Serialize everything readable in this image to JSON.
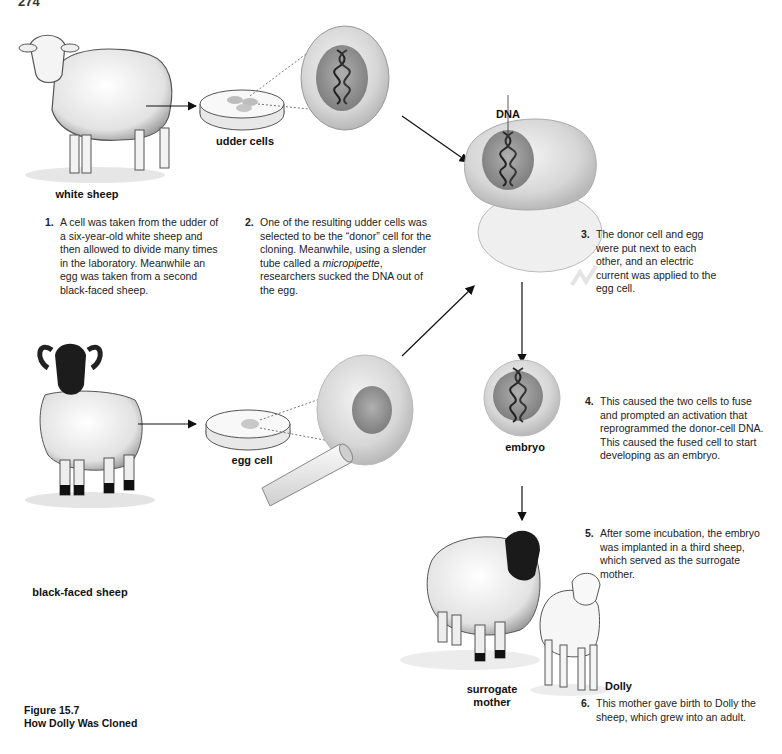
{
  "page_number": "274",
  "figure": {
    "number": "Figure 15.7",
    "title": "How Dolly Was Cloned"
  },
  "labels": {
    "white_sheep": "white sheep",
    "udder_cells": "udder cells",
    "dna": "DNA",
    "black_faced_sheep": "black-faced sheep",
    "egg_cell": "egg cell",
    "embryo": "embryo",
    "surrogate_mother_line1": "surrogate",
    "surrogate_mother_line2": "mother",
    "dolly": "Dolly"
  },
  "steps": [
    {
      "num": "1.",
      "text_lines": [
        "A cell was taken from the udder of",
        "a six-year-old white sheep and",
        "then allowed to divide many times",
        "in the laboratory. Meanwhile an",
        "egg was taken from a second",
        "black-faced sheep."
      ]
    },
    {
      "num": "2.",
      "text_pre": "One of the resulting udder cells was selected to be the “donor” cell for the cloning. Meanwhile, using a slender tube called a ",
      "text_em": "micropipette",
      "text_post": ", researchers sucked the DNA out of the egg."
    },
    {
      "num": "3.",
      "text": "The donor cell and egg were put next to each other, and an electric current was applied to the egg cell."
    },
    {
      "num": "4.",
      "text": "This caused the two cells to fuse and prompted an activation that reprogrammed the donor-cell DNA. This caused the fused cell to start developing as an embryo."
    },
    {
      "num": "5.",
      "text": "After some incubation, the embryo was implanted in a third sheep, which served as the surrogate mother."
    },
    {
      "num": "6.",
      "text": "This mother gave birth to Dolly the sheep, which grew into an adult."
    }
  ],
  "illustrations": [
    {
      "name": "white-sheep",
      "icon": "sheep-illustration"
    },
    {
      "name": "udder-cells-dish",
      "icon": "petri-dish-illustration"
    },
    {
      "name": "donor-cell",
      "icon": "cell-with-dna-illustration"
    },
    {
      "name": "fused-cells",
      "icon": "fused-cells-illustration"
    },
    {
      "name": "black-faced-sheep",
      "icon": "ram-illustration"
    },
    {
      "name": "egg-cell-dish",
      "icon": "petri-dish-illustration"
    },
    {
      "name": "egg-micropipette",
      "icon": "micropipette-illustration"
    },
    {
      "name": "embryo",
      "icon": "embryo-illustration"
    },
    {
      "name": "surrogate-mother",
      "icon": "black-faced-ewe-illustration"
    },
    {
      "name": "dolly",
      "icon": "lamb-illustration"
    }
  ],
  "colors": {
    "ink": "#1a1a1a",
    "cell_fill": "#d9d9d9",
    "nucleus": "#9a9a9a"
  }
}
